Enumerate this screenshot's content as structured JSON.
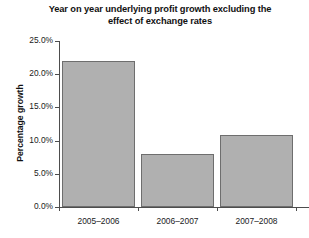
{
  "chart_data": {
    "type": "bar",
    "title": "Year on year underlying profit growth excluding the effect of exchange rates",
    "title_line1": "Year on year underlying profit growth excluding the",
    "title_line2": "effect of exchange rates",
    "xlabel": "",
    "ylabel": "Percentage growth",
    "categories": [
      "2005–2006",
      "2006–2007",
      "2007–2008"
    ],
    "values": [
      22.0,
      8.0,
      10.8
    ],
    "ylim": [
      0,
      25
    ],
    "ytick_values": [
      0.0,
      5.0,
      10.0,
      15.0,
      20.0,
      25.0
    ],
    "ytick_labels": [
      "0.0%",
      "5.0%",
      "10.0%",
      "15.0%",
      "20.0%",
      "25.0%"
    ],
    "grid": false,
    "legend": false,
    "legend_position": "none",
    "bar_color": "#b0b0b0",
    "bar_border_color": "#6e6e6e",
    "axis_color": "#4d4d4d",
    "background_color": "#ffffff",
    "text_color": "#1a1a1a"
  }
}
